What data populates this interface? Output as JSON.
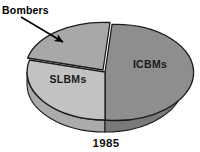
{
  "chart_data": {
    "type": "pie",
    "title": "",
    "subtitle": "",
    "xlabel": "",
    "ylabel": "",
    "year_label": "1985",
    "legend_position": "none",
    "grid": false,
    "three_d": true,
    "exploded_slice": "Bombers",
    "categories": [
      "ICBMs",
      "SLBMs",
      "Bombers"
    ],
    "values": [
      52,
      40,
      8
    ],
    "series": [
      {
        "name": "1985 Strategic Forces",
        "values": [
          52,
          40,
          8
        ]
      }
    ],
    "slices": [
      {
        "label": "ICBMs",
        "value": 52,
        "color": "#8e8e8e",
        "side_color": "#7a7a7a",
        "label_x": 150,
        "label_y": 67,
        "exploded": false
      },
      {
        "label": "SLBMs",
        "value": 40,
        "color": "#c2c2c2",
        "side_color": "#ababab",
        "label_x": 68,
        "label_y": 82,
        "exploded": false
      },
      {
        "label": "Bombers",
        "value": 8,
        "color": "#a8a8a8",
        "side_color": "#949494",
        "label_x": 23,
        "label_y": 13,
        "exploded": true
      }
    ],
    "colors": {
      "icbms": "#8e8e8e",
      "slbms": "#c2c2c2",
      "bombers": "#a8a8a8",
      "outline": "#1c1c1c",
      "background": "#ffffff",
      "text": "#111111"
    }
  },
  "labels": {
    "icbms": "ICBMs",
    "slbms": "SLBMs",
    "bombers": "Bombers",
    "year": "1985"
  },
  "callout": {
    "bombers_leader_from_x": 21,
    "bombers_leader_from_y": 17,
    "bombers_leader_to_x": 64,
    "bombers_leader_to_y": 43
  }
}
